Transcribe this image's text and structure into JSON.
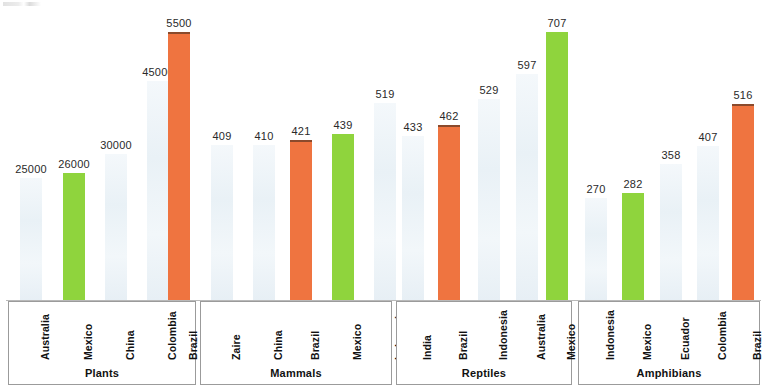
{
  "chart_data": {
    "type": "bar",
    "title": "",
    "subtitle": "",
    "xlabel": "",
    "ylabel": "",
    "grid": false,
    "legend": null,
    "colors": {
      "highlight_orange": "#EF7440",
      "highlight_green": "#8FD43D",
      "default_pale": "#EDF3F7",
      "box_border": "#9B9B9B",
      "baseline": "#B9B9B9",
      "text": "#111111"
    },
    "groups": [
      {
        "name": "Plants",
        "categories": [
          "Australia",
          "Mexico",
          "China",
          "Colombia",
          "Brazil"
        ],
        "values": [
          25000,
          26000,
          30000,
          45000,
          5500
        ],
        "value_labels": [
          "25000",
          "26000",
          "30000",
          "45000",
          "5500"
        ],
        "bar_colors": [
          "pale",
          "green",
          "pale",
          "pale",
          "orange"
        ],
        "ymax": 55000
      },
      {
        "name": "Mammals",
        "categories": [
          "Zaire",
          "China",
          "Brazil",
          "Mexico",
          "Indonesia"
        ],
        "values": [
          409,
          410,
          421,
          439,
          519
        ],
        "value_labels": [
          "409",
          "410",
          "421",
          "439",
          "519"
        ],
        "bar_colors": [
          "pale",
          "pale",
          "orange",
          "green",
          "pale"
        ],
        "ymax": 707
      },
      {
        "name": "Reptiles",
        "categories": [
          "India",
          "Brazil",
          "Indonesia",
          "Australia",
          "Mexico"
        ],
        "values": [
          433,
          462,
          529,
          597,
          707
        ],
        "value_labels": [
          "433",
          "462",
          "529",
          "597",
          "707"
        ],
        "bar_colors": [
          "pale",
          "orange",
          "pale",
          "pale",
          "green"
        ],
        "ymax": 707
      },
      {
        "name": "Amphibians",
        "categories": [
          "Indonesia",
          "Mexico",
          "Ecuador",
          "Colombia",
          "Brazil"
        ],
        "values": [
          270,
          282,
          358,
          407,
          516
        ],
        "value_labels": [
          "270",
          "282",
          "358",
          "407",
          "516"
        ],
        "bar_colors": [
          "pale",
          "green",
          "pale",
          "pale",
          "orange"
        ],
        "ymax": 707
      }
    ]
  }
}
